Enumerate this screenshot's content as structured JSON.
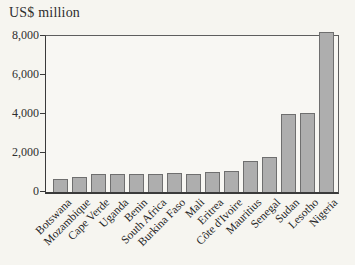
{
  "figure": {
    "unit_label": "US$ million"
  },
  "colors": {
    "page_background": "#f6f5f0",
    "plot_background": "#f8f7f3",
    "bar_fill": "#aeaeae",
    "bar_border": "#6f6f6f",
    "axis": "#3a3a3a",
    "text": "#2b2b2b"
  },
  "chart_data": {
    "type": "bar",
    "title": "",
    "xlabel": "",
    "ylabel": "US$ million",
    "categories": [
      "Botswana",
      "Mozambique",
      "Cape Verde",
      "Uganda",
      "Benin",
      "South Africa",
      "Burkina Faso",
      "Mali",
      "Eritrea",
      "Côte d'Ivoire",
      "Mauritius",
      "Senegal",
      "Sudan",
      "Lesotho",
      "Nigeria"
    ],
    "values": [
      650,
      750,
      950,
      900,
      950,
      900,
      975,
      950,
      1050,
      1080,
      1600,
      1780,
      3980,
      4060,
      8200
    ],
    "ylim": [
      0,
      8000
    ],
    "yticks": [
      {
        "value": 0,
        "label": "0"
      },
      {
        "value": 2000,
        "label": "2,000"
      },
      {
        "value": 4000,
        "label": "4,000"
      },
      {
        "value": 6000,
        "label": "6,000"
      },
      {
        "value": 8000,
        "label": "8,000"
      }
    ],
    "grid": false,
    "legend": "none",
    "bar_color": "#aeaeae",
    "bar_border_color": "#6f6f6f",
    "x_label_rotation_deg": -45
  }
}
